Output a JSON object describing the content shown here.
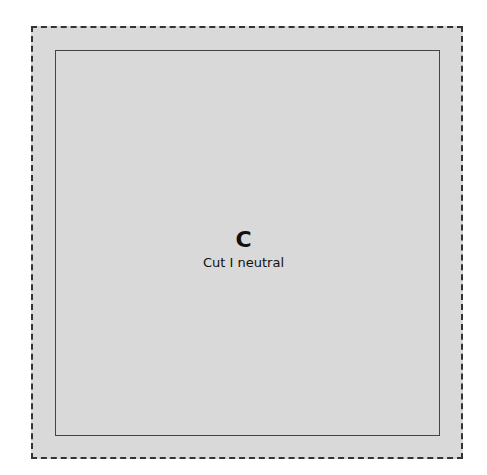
{
  "panel": {
    "letter": "C",
    "caption": "Cut I neutral"
  },
  "colors": {
    "fill": "#d9d9d9",
    "border": "#333333"
  }
}
